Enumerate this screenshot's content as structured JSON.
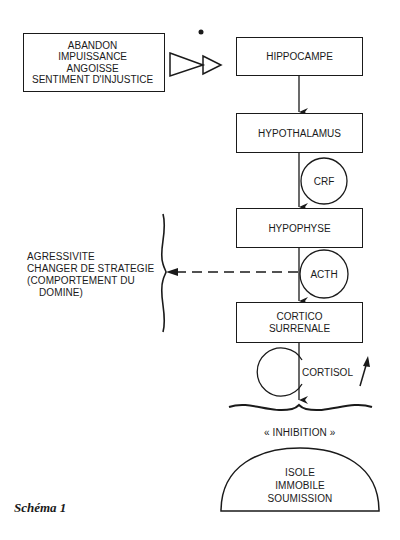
{
  "diagram": {
    "stressors_box": {
      "lines": [
        "ABANDON",
        "IMPUISSANCE",
        "ANGOISSE",
        "SENTIMENT D'INJUSTICE"
      ]
    },
    "chain": [
      {
        "id": "hippocampe",
        "label": "HIPPOCAMPE"
      },
      {
        "id": "hypothalamus",
        "label": "HYPOTHALAMUS"
      },
      {
        "id": "hypophyse",
        "label": "HYPOPHYSE"
      },
      {
        "id": "cortico-surrenale",
        "lines": [
          "CORTICO",
          "SURRENALE"
        ]
      }
    ],
    "hormones": [
      {
        "id": "crf",
        "label": "CRF"
      },
      {
        "id": "acth",
        "label": "ACTH"
      },
      {
        "id": "cortisol",
        "label": "CORTISOL",
        "trend": "increase"
      }
    ],
    "alternative_response": {
      "lines": [
        "AGRESSIVITE",
        "CHANGER DE STRATEGIE",
        "(COMPORTEMENT DU",
        "DOMINE)"
      ]
    },
    "inhibition_label": "« INHIBITION »",
    "outcome_dome": {
      "lines": [
        "ISOLE",
        "IMMOBILE",
        "SOUMISSION"
      ]
    },
    "caption": "Schéma 1"
  }
}
